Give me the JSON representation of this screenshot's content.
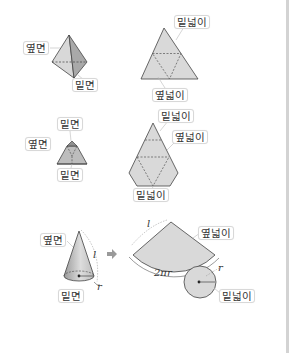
{
  "figures": {
    "tetrahedron": {
      "side_label": "옆면",
      "base_label": "밑면",
      "net_base_area_label": "밑넓이",
      "net_side_area_label": "옆넓이"
    },
    "frustum": {
      "top_base_label": "밑면",
      "side_label": "옆면",
      "bottom_base_label": "밑면",
      "net_top_area_label": "밑넓이",
      "net_side_area_label": "옆넓이",
      "net_bottom_area_label": "밑넓이"
    },
    "cone": {
      "side_label": "옆면",
      "base_label": "밑면",
      "slant_symbol": "l",
      "radius_symbol": "r",
      "arrow": "➡",
      "net_side_area_label": "옆넓이",
      "net_base_area_label": "밑넓이",
      "net_slant_symbol": "l",
      "arc_length_symbol": "2πr",
      "net_radius_symbol": "r"
    }
  },
  "colors": {
    "fill": "#d9d9d9",
    "fill_dark": "#a8a8a8",
    "stroke": "#444444",
    "divider": "#d3d3d3"
  }
}
